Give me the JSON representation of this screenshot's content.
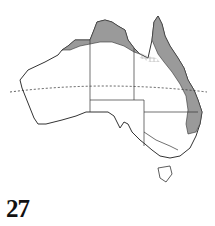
{
  "figure": {
    "label": "27",
    "colors": {
      "range_fill": "#9a9a9a",
      "outline": "#333333",
      "background": "#ffffff",
      "hatch": "#bdbdbd"
    },
    "regions_shaded": [
      "northern coast (Kimberley to Arnhem Land / Gulf)",
      "eastern Queensland coast",
      "northeastern New South Wales coast"
    ],
    "regions_hatched": [
      "southeastern Gulf of Carpentaria"
    ],
    "reference_line": "Tropic of Capricorn (dashed)"
  }
}
